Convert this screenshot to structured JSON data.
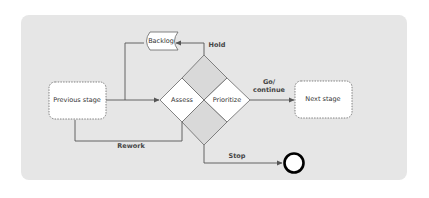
{
  "diagram": {
    "type": "process-flow",
    "colors": {
      "panel_background": "#e6e6e6",
      "node_fill": "#ffffff",
      "line": "#555555",
      "diamond_quadrant_fill": "#d9d9d9"
    },
    "nodes": {
      "previous_stage": "Previous stage",
      "next_stage": "Next stage",
      "backlog": "Backlog",
      "assess": "Assess",
      "prioritize": "Prioritize",
      "stop_terminal": "end-circle"
    },
    "edge_labels": {
      "hold": "Hold",
      "go_continue_line1": "Go/",
      "go_continue_line2": "continue",
      "rework": "Rework",
      "stop": "Stop"
    },
    "edges": [
      {
        "from": "Previous stage",
        "to": "Assess"
      },
      {
        "from": "Previous stage",
        "to": "Backlog",
        "note": "branch line up to Backlog"
      },
      {
        "from": "Decision diamond (top)",
        "to": "Backlog",
        "label": "Hold"
      },
      {
        "from": "Prioritize",
        "to": "Next stage",
        "label": "Go/ continue"
      },
      {
        "from": "Assess",
        "to": "Previous stage",
        "label": "Rework"
      },
      {
        "from": "Decision diamond (bottom)",
        "to": "end-circle",
        "label": "Stop"
      }
    ]
  }
}
